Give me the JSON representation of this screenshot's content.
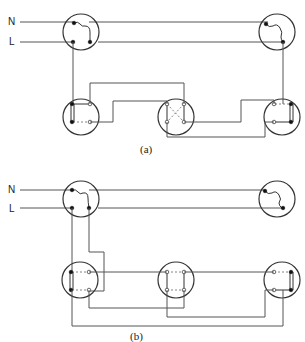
{
  "diagrams": [
    {
      "id": "a",
      "caption": "(a)",
      "supply_labels": {
        "neutral": "N",
        "live": "L"
      },
      "components": [
        "ceiling-rose-left",
        "ceiling-rose-right",
        "two-way-switch-1",
        "intermediate-switch",
        "two-way-switch-2"
      ]
    },
    {
      "id": "b",
      "caption": "(b)",
      "supply_labels": {
        "neutral": "N",
        "live": "L"
      },
      "components": [
        "ceiling-rose-left",
        "ceiling-rose-right",
        "two-way-switch-1",
        "intermediate-switch",
        "two-way-switch-2"
      ]
    }
  ],
  "colors": {
    "wire": "#555555",
    "outline": "#333333",
    "background": "#ffffff"
  }
}
